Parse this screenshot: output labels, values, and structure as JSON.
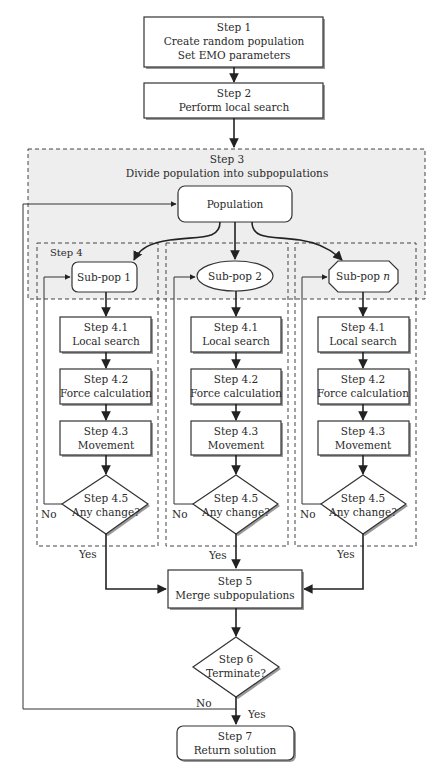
{
  "diagram": {
    "type": "flowchart",
    "step1": {
      "title": "Step 1",
      "line1": "Create random population",
      "line2": "Set EMO parameters"
    },
    "step2": {
      "title": "Step 2",
      "line1": "Perform local search"
    },
    "step3": {
      "title": "Step 3",
      "line1": "Divide population into subpopulations"
    },
    "population": {
      "label": "Population"
    },
    "step4": {
      "title": "Step 4"
    },
    "subpops": [
      {
        "label": "Sub-pop 1",
        "shape": "rounded-rect",
        "s41_title": "Step 4.1",
        "s41_text": "Local search",
        "s42_title": "Step 4.2",
        "s42_text": "Force calculation",
        "s43_title": "Step 4.3",
        "s43_text": "Movement",
        "s45_title": "Step 4.5",
        "s45_text": "Any change?",
        "no": "No",
        "yes": "Yes"
      },
      {
        "label": "Sub-pop 2",
        "shape": "ellipse",
        "s41_title": "Step 4.1",
        "s41_text": "Local search",
        "s42_title": "Step 4.2",
        "s42_text": "Force calculation",
        "s43_title": "Step 4.3",
        "s43_text": "Movement",
        "s45_title": "Step 4.5",
        "s45_text": "Any change?",
        "no": "No",
        "yes": "Yes"
      },
      {
        "label_prefix": "Sub-pop ",
        "label_italic": "n",
        "shape": "octagon",
        "s41_title": "Step 4.1",
        "s41_text": "Local search",
        "s42_title": "Step 4.2",
        "s42_text": "Force calculation",
        "s43_title": "Step 4.3",
        "s43_text": "Movement",
        "s45_title": "Step 4.5",
        "s45_text": "Any change?",
        "no": "No",
        "yes": "Yes"
      }
    ],
    "step5": {
      "title": "Step 5",
      "line1": "Merge subpopulations"
    },
    "step6": {
      "title": "Step 6",
      "line1": "Terminate?",
      "no": "No",
      "yes": "Yes"
    },
    "step7": {
      "title": "Step 7",
      "line1": "Return solution"
    },
    "colors": {
      "region_fill": "#eeeeee",
      "stroke": "#333333",
      "background": "#ffffff"
    }
  }
}
